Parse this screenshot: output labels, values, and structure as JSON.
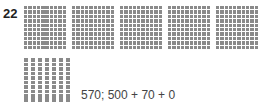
{
  "question": {
    "number": "22",
    "answer": "570; 500 + 70 + 0"
  },
  "blocks": {
    "hundreds_count": 5,
    "tens_count": 7,
    "ones_count": 0,
    "fill_color": "#8a8a8a"
  }
}
